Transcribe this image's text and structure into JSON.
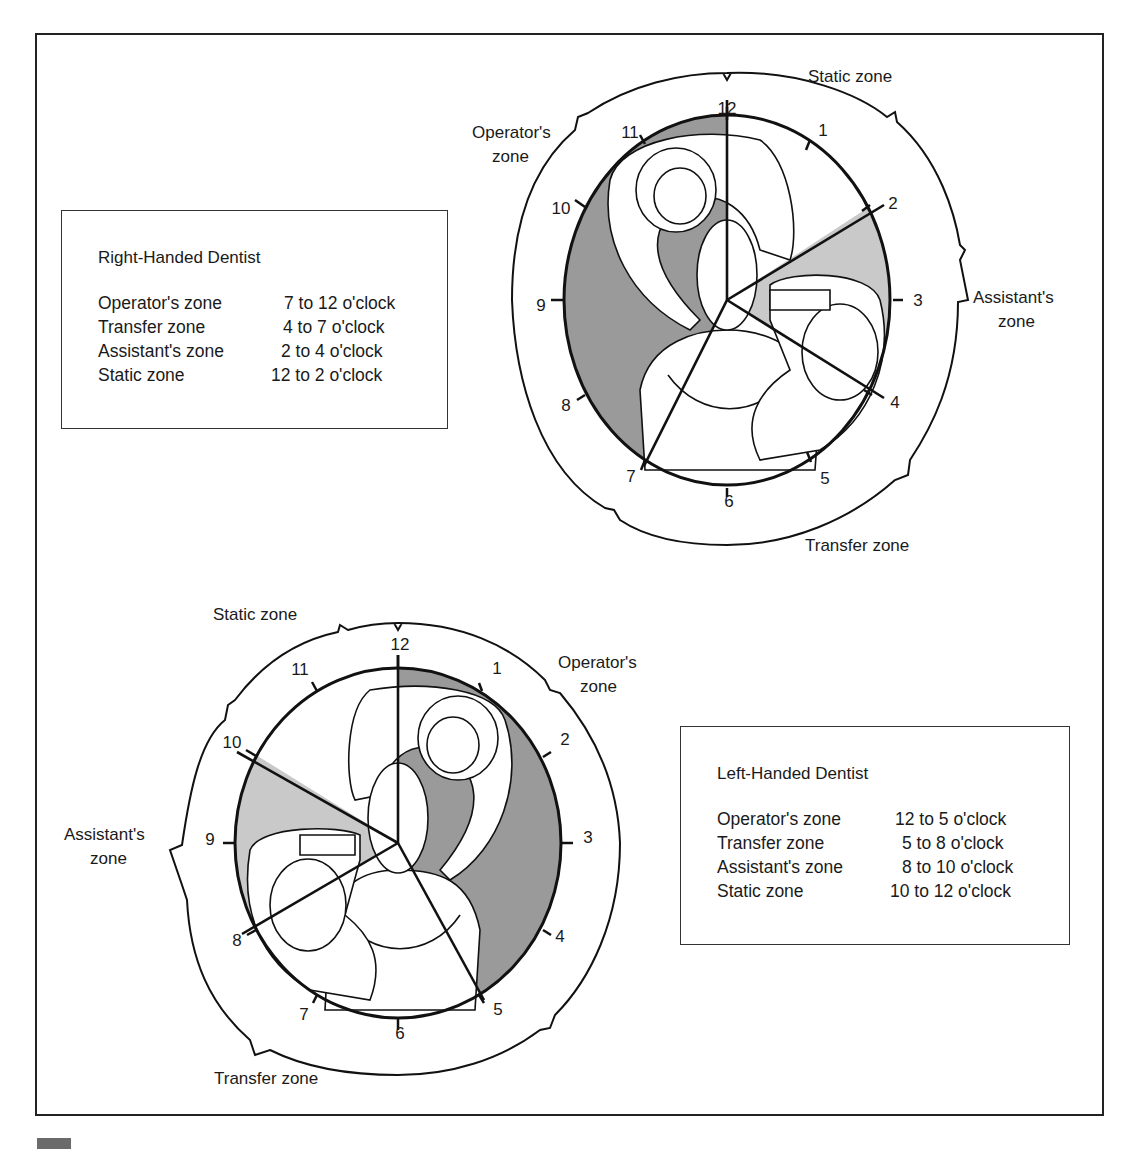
{
  "figure": {
    "colors": {
      "operator_zone": "#9a9a9a",
      "assistant_zone": "#c9c9c9",
      "line": "#111111",
      "background": "#ffffff"
    },
    "clock_numbers": [
      "12",
      "1",
      "2",
      "3",
      "4",
      "5",
      "6",
      "7",
      "8",
      "9",
      "10",
      "11"
    ]
  },
  "right_handed": {
    "legend": {
      "title": "Right-Handed Dentist",
      "rows": [
        {
          "zone": "Operator's zone",
          "range": "7 to 12 o'clock"
        },
        {
          "zone": "Transfer zone",
          "range": "4 to 7 o'clock"
        },
        {
          "zone": "Assistant's zone",
          "range": "2 to 4 o'clock"
        },
        {
          "zone": "Static zone",
          "range": "12 to 2 o'clock"
        }
      ]
    },
    "diagram": {
      "labels": {
        "static": "Static zone",
        "operator_1": "Operator's",
        "operator_2": "zone",
        "assistant_1": "Assistant's",
        "assistant_2": "zone",
        "transfer": "Transfer zone"
      },
      "zones": [
        {
          "name": "Operator's zone",
          "from": 7,
          "to": 12,
          "shade": "dark"
        },
        {
          "name": "Static zone",
          "from": 12,
          "to": 2,
          "shade": "none"
        },
        {
          "name": "Assistant's zone",
          "from": 2,
          "to": 4,
          "shade": "light"
        },
        {
          "name": "Transfer zone",
          "from": 4,
          "to": 7,
          "shade": "none"
        }
      ]
    }
  },
  "left_handed": {
    "legend": {
      "title": "Left-Handed Dentist",
      "rows": [
        {
          "zone": "Operator's zone",
          "range": "12 to 5 o'clock"
        },
        {
          "zone": "Transfer zone",
          "range": "5 to 8 o'clock"
        },
        {
          "zone": "Assistant's zone",
          "range": "8 to 10 o'clock"
        },
        {
          "zone": "Static zone",
          "range": "10 to 12 o'clock"
        }
      ]
    },
    "diagram": {
      "labels": {
        "static": "Static zone",
        "operator_1": "Operator's",
        "operator_2": "zone",
        "assistant_1": "Assistant's",
        "assistant_2": "zone",
        "transfer": "Transfer zone"
      },
      "zones": [
        {
          "name": "Operator's zone",
          "from": 12,
          "to": 5,
          "shade": "dark"
        },
        {
          "name": "Transfer zone",
          "from": 5,
          "to": 8,
          "shade": "none"
        },
        {
          "name": "Assistant's zone",
          "from": 8,
          "to": 10,
          "shade": "light"
        },
        {
          "name": "Static zone",
          "from": 10,
          "to": 12,
          "shade": "none"
        }
      ]
    }
  }
}
